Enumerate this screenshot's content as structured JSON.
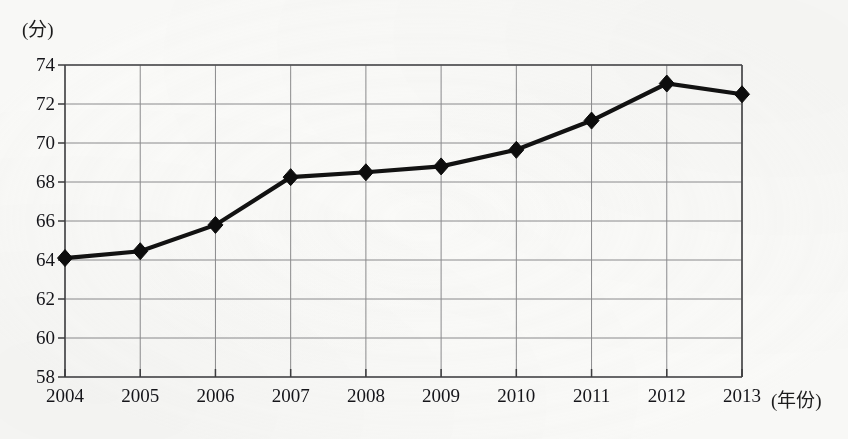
{
  "chart_data": {
    "type": "line",
    "title": "",
    "xlabel": "(年份)",
    "ylabel": "(分)",
    "categories": [
      "2004",
      "2005",
      "2006",
      "2007",
      "2008",
      "2009",
      "2010",
      "2011",
      "2012",
      "2013"
    ],
    "values": [
      64.1,
      64.45,
      65.8,
      68.25,
      68.5,
      68.8,
      69.65,
      71.15,
      73.05,
      72.5
    ],
    "series": [
      {
        "name": "",
        "values": [
          64.1,
          64.45,
          65.8,
          68.25,
          68.5,
          68.8,
          69.65,
          71.15,
          73.05,
          72.5
        ]
      }
    ],
    "ylim": [
      58,
      74
    ],
    "xlim": [
      "2004",
      "2013"
    ],
    "ytick_labels": [
      "58",
      "60",
      "62",
      "64",
      "66",
      "68",
      "70",
      "72",
      "74"
    ],
    "ytick_values": [
      58,
      60,
      62,
      64,
      66,
      68,
      70,
      72,
      74
    ],
    "xtick_labels": [
      "2004",
      "2005",
      "2006",
      "2007",
      "2008",
      "2009",
      "2010",
      "2011",
      "2012",
      "2013"
    ],
    "grid": true,
    "legend": false,
    "marker": "diamond",
    "line_color": "#121212",
    "grid_color": "#8c8c8e",
    "axis_color": "#4a4a4c",
    "background_color": "#fbfbf9"
  }
}
